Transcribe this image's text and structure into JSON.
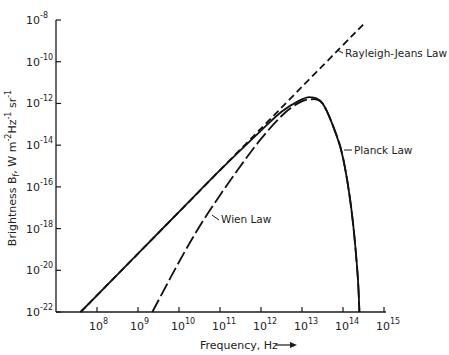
{
  "chart_data": {
    "type": "line",
    "title": "",
    "xlabel": "Frequency, Hz",
    "ylabel": "Brightness B_f , W m^-2 Hz^-1 sr^-1",
    "x_scale": "log",
    "y_scale": "log",
    "xlim_log10": [
      7.0,
      15.0
    ],
    "ylim_log10": [
      -22,
      -8
    ],
    "grid": false,
    "legend": "inline labels",
    "x_ticks": [
      {
        "base": "10",
        "exp": "8"
      },
      {
        "base": "10",
        "exp": "9"
      },
      {
        "base": "10",
        "exp": "10"
      },
      {
        "base": "10",
        "exp": "11"
      },
      {
        "base": "10",
        "exp": "12"
      },
      {
        "base": "10",
        "exp": "13"
      },
      {
        "base": "10",
        "exp": "14"
      },
      {
        "base": "10",
        "exp": "15"
      }
    ],
    "y_ticks": [
      {
        "base": "10",
        "exp": "-8"
      },
      {
        "base": "10",
        "exp": "-10"
      },
      {
        "base": "10",
        "exp": "-12"
      },
      {
        "base": "10",
        "exp": "-14"
      },
      {
        "base": "10",
        "exp": "-16"
      },
      {
        "base": "10",
        "exp": "-18"
      },
      {
        "base": "10",
        "exp": "-20"
      },
      {
        "base": "10",
        "exp": "-22"
      }
    ],
    "series": [
      {
        "name": "Rayleigh-Jeans Law",
        "style": "dashed",
        "log10_x": [
          7.6,
          14.5
        ],
        "log10_y": [
          -22.0,
          -8.2
        ]
      },
      {
        "name": "Planck Law",
        "style": "solid",
        "log10_x": [
          7.6,
          9.0,
          10.0,
          11.0,
          12.0,
          12.5,
          12.9,
          13.2,
          13.5,
          13.8,
          14.0,
          14.2,
          14.35,
          14.4
        ],
        "log10_y": [
          -22.0,
          -19.2,
          -17.2,
          -15.2,
          -13.3,
          -12.4,
          -11.9,
          -11.7,
          -12.0,
          -13.3,
          -14.6,
          -17.0,
          -20.0,
          -22.0
        ]
      },
      {
        "name": "Wien Law",
        "style": "long-dashed",
        "log10_x": [
          9.35,
          10.0,
          10.5,
          11.0,
          11.5,
          12.0,
          12.5,
          12.9,
          13.2,
          13.5,
          13.8,
          14.0,
          14.2,
          14.35,
          14.4
        ],
        "log10_y": [
          -22.0,
          -19.6,
          -17.9,
          -16.4,
          -15.0,
          -13.7,
          -12.6,
          -12.0,
          -11.8,
          -12.0,
          -13.3,
          -14.6,
          -17.0,
          -20.0,
          -22.0
        ]
      }
    ],
    "annotations": [
      {
        "text": "Rayleigh-Jeans Law",
        "points_to": "Rayleigh-Jeans Law"
      },
      {
        "text": "Planck Law",
        "points_to": "Planck Law"
      },
      {
        "text": "Wien Law",
        "points_to": "Wien Law"
      }
    ]
  },
  "labels": {
    "x_axis_title": "Frequency, Hz",
    "x_axis_arrow": "→",
    "y_axis_title_main": "Brightness B",
    "y_axis_title_sub": "f",
    "y_axis_title_units": ", W m",
    "y_axis_units_exp1": "-2",
    "y_axis_units_hz": "Hz",
    "y_axis_units_exp2": "-1",
    "y_axis_units_sr": " sr",
    "y_axis_units_exp3": "-1",
    "rj": "Rayleigh-Jeans Law",
    "planck": "Planck Law",
    "wien": "Wien Law"
  }
}
